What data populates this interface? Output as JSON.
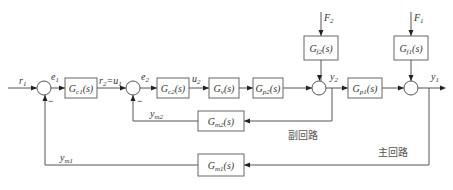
{
  "diagram": {
    "signals": {
      "r1": {
        "main": "r",
        "sub": "1"
      },
      "e1": {
        "main": "e",
        "sub": "1"
      },
      "r2u1": {
        "main": "r",
        "sub": "2",
        "eq": "=u",
        "sub2": "1"
      },
      "e2": {
        "main": "e",
        "sub": "2"
      },
      "u2": {
        "main": "u",
        "sub": "2"
      },
      "y2": {
        "main": "y",
        "sub": "2"
      },
      "y1": {
        "main": "y",
        "sub": "1"
      },
      "ym2": {
        "main": "y",
        "sub": "m2"
      },
      "ym1": {
        "main": "y",
        "sub": "m1"
      },
      "F2": {
        "main": "F",
        "sub": "2"
      },
      "F1": {
        "main": "F",
        "sub": "1"
      }
    },
    "blocks": {
      "gc1": {
        "main": "G",
        "sub": "c1",
        "arg": "(s)"
      },
      "gc2": {
        "main": "G",
        "sub": "c2",
        "arg": "(s)"
      },
      "gv": {
        "main": "G",
        "sub": "v",
        "arg": "(s)"
      },
      "gp2": {
        "main": "G",
        "sub": "p2",
        "arg": "(s)"
      },
      "gp1": {
        "main": "G",
        "sub": "p1",
        "arg": "(s)"
      },
      "gf2": {
        "main": "G",
        "sub": "f2",
        "arg": "(s)"
      },
      "gf1": {
        "main": "G",
        "sub": "f1",
        "arg": "(s)"
      },
      "gm2": {
        "main": "G",
        "sub": "m2",
        "arg": "(s)"
      },
      "gm1": {
        "main": "G",
        "sub": "m1",
        "arg": "(s)"
      }
    },
    "signs": {
      "sum1_minus": "−",
      "sum2_minus": "−"
    },
    "loops": {
      "inner": "副回路",
      "outer": "主回路"
    }
  }
}
